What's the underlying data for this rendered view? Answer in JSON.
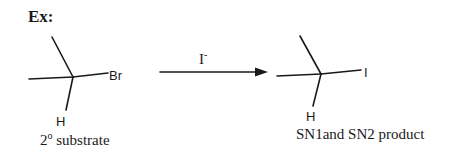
{
  "heading": "Ex:",
  "reactant": {
    "atoms": {
      "leaving_group": "Br",
      "hydrogen": "H"
    },
    "caption": "2º substrate",
    "caption_parts": {
      "number": "2",
      "degree": "o",
      "text": " substrate"
    }
  },
  "reagent": {
    "symbol": "I",
    "charge": "-"
  },
  "product": {
    "atoms": {
      "nucleophile": "I",
      "hydrogen": "H"
    },
    "caption": "SN1and SN2 product"
  },
  "colors": {
    "ink": "#1a1a1a",
    "background": "#ffffff"
  }
}
